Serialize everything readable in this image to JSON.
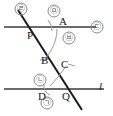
{
  "figure": {
    "type": "geometry-diagram",
    "colors": {
      "line": "#3a3a3a",
      "transversal": "#1a1a1a",
      "arc": "#9a9a9a",
      "label": "#1a1a1a",
      "circled_label": "#555555"
    },
    "points": {
      "P": "P",
      "A": "A",
      "B": "B",
      "C": "C",
      "D": "D",
      "Q": "Q"
    },
    "line_label": "l",
    "angles": {
      "a1": "㉠",
      "a2": "㉡",
      "a3": "㉢",
      "a4": "㉣",
      "a5": "㉤",
      "a6": "㉥"
    }
  }
}
